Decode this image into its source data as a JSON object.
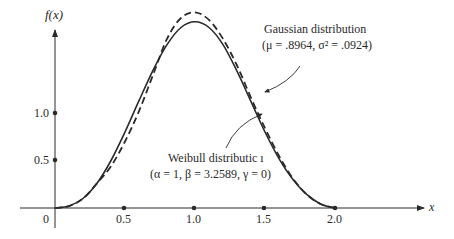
{
  "chart_data": {
    "type": "line",
    "title": "",
    "xlabel": "x",
    "ylabel": "f(x)",
    "x_ticks": [
      "0",
      "0.5",
      "1.0",
      "1.5",
      "2.0"
    ],
    "y_ticks": [
      "0.5",
      "1.0"
    ],
    "xlim": [
      0,
      2.2
    ],
    "ylim": [
      0,
      2.1
    ],
    "grid": false,
    "series": [
      {
        "name": "Weibull distribution",
        "params": "(α = 1, β = 3.2589, γ = 0)",
        "style": "solid",
        "x": [
          0,
          0.1,
          0.2,
          0.3,
          0.4,
          0.5,
          0.6,
          0.7,
          0.8,
          0.9,
          1.0,
          1.1,
          1.2,
          1.3,
          1.4,
          1.5,
          1.6,
          1.7,
          1.8,
          1.9,
          2.0
        ],
        "values": [
          0,
          0.02,
          0.1,
          0.26,
          0.5,
          0.8,
          1.13,
          1.45,
          1.72,
          1.9,
          1.96,
          1.9,
          1.72,
          1.44,
          1.12,
          0.8,
          0.52,
          0.3,
          0.14,
          0.04,
          0
        ]
      },
      {
        "name": "Gaussian distribution",
        "params": "(μ = .8964, σ² = .0924)",
        "style": "dashed",
        "x": [
          0,
          0.1,
          0.2,
          0.3,
          0.4,
          0.5,
          0.6,
          0.7,
          0.8,
          0.9,
          1.0,
          1.1,
          1.2,
          1.3,
          1.4,
          1.5,
          1.6,
          1.7,
          1.8,
          1.9,
          2.0
        ],
        "values": [
          0,
          0.02,
          0.1,
          0.26,
          0.44,
          0.7,
          1.02,
          1.4,
          1.78,
          2.0,
          2.06,
          1.98,
          1.78,
          1.5,
          1.16,
          0.84,
          0.55,
          0.31,
          0.14,
          0.04,
          0
        ]
      }
    ],
    "annotations": [
      {
        "text": "Gaussian distribution",
        "line2": "(μ = .8964, σ² = .0924)"
      },
      {
        "text": "Weibull distributic ı",
        "line2": "(α = 1, β = 3.2589, γ = 0)"
      }
    ]
  },
  "labels": {
    "ylabel": "f(x)",
    "xlabel": "x",
    "x0": "0",
    "x05": "0.5",
    "x10": "1.0",
    "x15": "1.5",
    "x20": "2.0",
    "y05": "0.5",
    "y10": "1.0",
    "gauss_title": "Gaussian distribution",
    "gauss_params": "(μ = .8964, σ² = .0924)",
    "weibull_title": "Weibull distributic ı",
    "weibull_params": "(α = 1, β = 3.2589, γ = 0)"
  }
}
